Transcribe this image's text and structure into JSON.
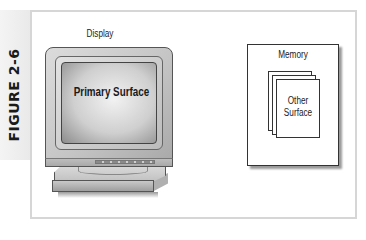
{
  "figure": {
    "label": "FIGURE 2-6"
  },
  "diagram": {
    "display": {
      "label": "Display",
      "screen_label": "Primary Surface"
    },
    "memory": {
      "label": "Memory",
      "stack_label_line1": "Other",
      "stack_label_line2": "Surface",
      "stacked_pages": 3
    }
  },
  "colors": {
    "frame_border": "#d6d6d6",
    "strip_bg": "#eeeeee",
    "outline": "#333333",
    "monitor_gray": "#c4c4c4"
  }
}
